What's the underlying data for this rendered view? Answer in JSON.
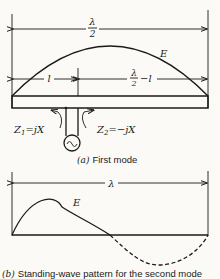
{
  "figure_a": {
    "total_length_label_num": "λ",
    "total_length_label_den": "2",
    "wave_label": "E",
    "left_segment_label": "l",
    "right_segment_num": "λ",
    "right_segment_den": "2",
    "right_segment_suffix": "−l",
    "z1_label": "Z",
    "z1_sub": "1",
    "z1_value": "=jX",
    "z2_label": "Z",
    "z2_sub": "2",
    "z2_value": "=−jX",
    "source_symbol": "~",
    "caption_letter": "(a)",
    "caption_text": "First mode"
  },
  "figure_b": {
    "total_length_label": "λ",
    "wave_label": "E",
    "caption_letter": "(b)",
    "caption_text": "Standing-wave pattern for the second mode"
  }
}
